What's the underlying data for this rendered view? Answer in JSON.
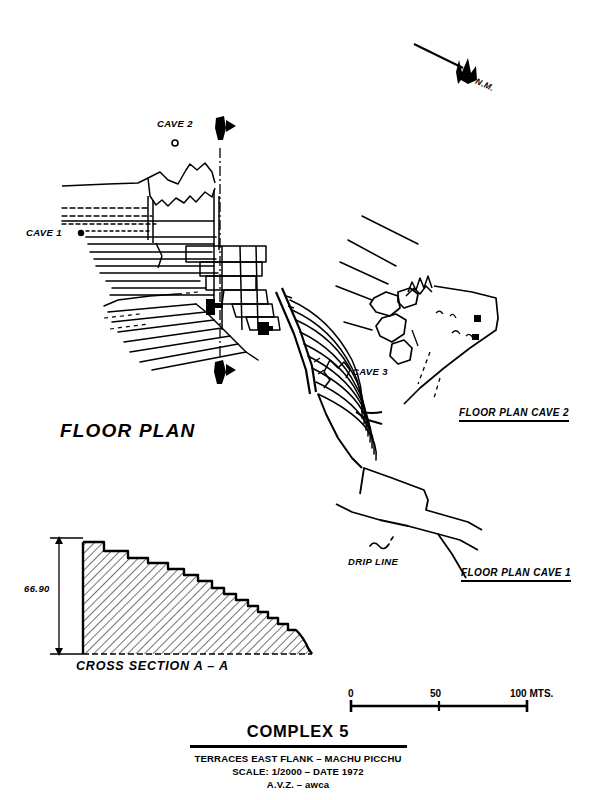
{
  "document": {
    "type": "archaeological-site-plan",
    "background_color": "#ffffff",
    "ink_color": "#000000"
  },
  "north_arrow": {
    "label": "N.M."
  },
  "plan_labels": {
    "floor_plan": "FLOOR PLAN",
    "cave_1": "CAVE 1",
    "cave_2": "CAVE 2",
    "cave_3": "CAVE 3",
    "floor_plan_cave_1": "FLOOR PLAN CAVE 1",
    "floor_plan_cave_2": "FLOOR PLAN CAVE 2",
    "drip_line": "DRIP LINE",
    "section_marker_top": "A",
    "section_marker_bottom": "A"
  },
  "cross_section": {
    "title": "CROSS SECTION A – A",
    "height_dimension": "66.90"
  },
  "scale_bar": {
    "ticks": [
      "0",
      "50",
      "100 MTS."
    ],
    "start_value": 0,
    "mid_value": 50,
    "end_value": 100,
    "units": "MTS."
  },
  "title_block": {
    "title": "COMPLEX 5",
    "line_1": "TERRACES EAST FLANK – MACHU PICCHU",
    "line_2": "SCALE: 1/2000 – DATE 1972",
    "line_3": "A.V.Z. – awca"
  }
}
